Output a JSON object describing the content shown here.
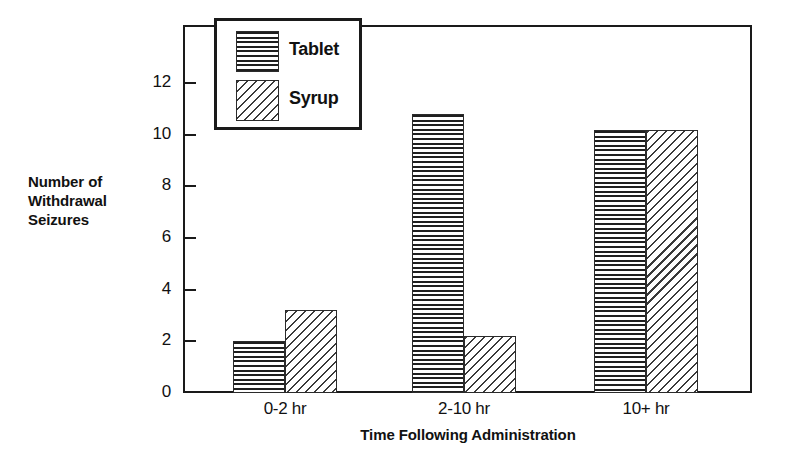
{
  "chart_data": {
    "type": "bar",
    "title": "",
    "xlabel": "Time Following Administration",
    "ylabel": "Number of\nWithdrawal\nSeizures",
    "categories": [
      "0-2 hr",
      "2-10 hr",
      "10+ hr"
    ],
    "series": [
      {
        "name": "Tablet",
        "values": [
          2.0,
          10.8,
          10.2
        ],
        "pattern": "horizontal-lines"
      },
      {
        "name": "Syrup",
        "values": [
          3.2,
          2.2,
          10.2
        ],
        "pattern": "diagonal-hatch"
      }
    ],
    "ylim": [
      0,
      13.5
    ],
    "yticks": [
      0,
      2,
      4,
      6,
      8,
      10,
      12
    ],
    "ytick_labels": [
      "0",
      "2",
      "4",
      "6",
      "8",
      "10",
      "12"
    ],
    "grid": false,
    "legend_position": "top-left-inside",
    "frame": true,
    "colors": {
      "axis": "#1a1a1a",
      "text": "#111111",
      "background": "#ffffff",
      "pattern_ink": "#2b2b2b"
    }
  },
  "legend": {
    "items": [
      {
        "label": "Tablet"
      },
      {
        "label": "Syrup"
      }
    ]
  }
}
